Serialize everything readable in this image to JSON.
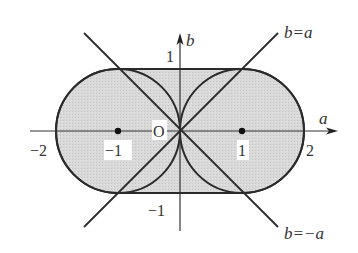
{
  "diagram": {
    "type": "region-plot",
    "axes": {
      "x_label": "a",
      "y_label": "b",
      "origin_label": "O",
      "x_ticks": [
        "−2",
        "−1",
        "1",
        "2"
      ],
      "y_ticks": [
        "1",
        "−1"
      ]
    },
    "lines": [
      {
        "label": "b=a",
        "equation": "b = a"
      },
      {
        "label": "b=−a",
        "equation": "b = −a"
      }
    ],
    "circles": [
      {
        "center": [
          -1,
          0
        ],
        "radius": 1
      },
      {
        "center": [
          1,
          0
        ],
        "radius": 1
      }
    ],
    "points": [
      {
        "name": "(-1,0)",
        "x": -1,
        "y": 0
      },
      {
        "name": "(1,0)",
        "x": 1,
        "y": 0
      }
    ],
    "region": {
      "description": "Shaded stadium shape: union of two unit circles centered at (±1,0) and rectangle −1≤a≤1, −1≤b≤1",
      "fill_color": "#d6d6d6",
      "stroke_color": "#2a2a2a"
    }
  }
}
